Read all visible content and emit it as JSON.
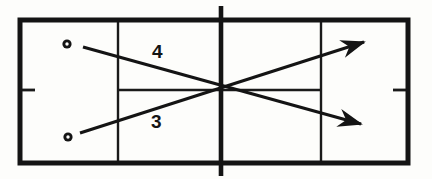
{
  "diagram": {
    "type": "court-trajectory-diagram",
    "background_color": "#fdfdfb",
    "line_color": "#141414",
    "court": {
      "name": "tennis-court-top-view",
      "outer_boundary": {
        "x1": 20,
        "y1": 20,
        "x2": 408,
        "y2": 163,
        "stroke_width": 5
      },
      "net": {
        "x": 221,
        "y1": 6,
        "y2": 176,
        "stroke_width": 4.5
      },
      "service_line_left": {
        "x": 118,
        "y1": 20,
        "y2": 163,
        "stroke_width": 2.4
      },
      "service_line_right": {
        "x": 321,
        "y1": 20,
        "y2": 163,
        "stroke_width": 2.4
      },
      "center_service_line": {
        "y": 90,
        "x1": 118,
        "x2": 321,
        "stroke_width": 2.4
      },
      "center_mark_left": {
        "x1": 20,
        "x2": 34,
        "y": 90,
        "stroke_width": 2.6
      },
      "center_mark_right": {
        "x1": 394,
        "x2": 408,
        "y": 90,
        "stroke_width": 2.6
      }
    },
    "markers": [
      {
        "name": "ball-position-upper",
        "cx": 67,
        "cy": 44,
        "r_outer": 4.6,
        "r_inner": 1.7
      },
      {
        "name": "ball-position-lower",
        "cx": 68,
        "cy": 137,
        "r_outer": 4.6,
        "r_inner": 1.7
      }
    ],
    "shots": [
      {
        "label": "4",
        "name": "shot-trajectory-4",
        "from_x": 83,
        "from_y": 47,
        "to_x": 365,
        "to_y": 126,
        "stroke_width": 3.2,
        "label_x": 152,
        "label_y": 42,
        "direction": "downward-crosscourt"
      },
      {
        "label": "3",
        "name": "shot-trajectory-3",
        "from_x": 80,
        "from_y": 133,
        "to_x": 368,
        "to_y": 40,
        "stroke_width": 3.2,
        "label_x": 151,
        "label_y": 112,
        "direction": "upward-crosscourt"
      }
    ],
    "crossing_point": {
      "x": 221,
      "y": 91
    }
  }
}
